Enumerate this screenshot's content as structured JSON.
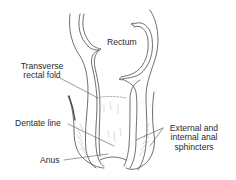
{
  "figure": {
    "type": "anatomical-illustration",
    "colors": {
      "line": "#4a4a4a",
      "label_text": "#2a2a2a",
      "leader_line": "#555555",
      "background": "#ffffff"
    }
  },
  "labels": {
    "rectum": "Rectum",
    "transverse_line1": "Transverse",
    "transverse_line2": "rectal fold",
    "dentate": "Dentate line",
    "anus": "Anus",
    "sphincters_line1": "External and",
    "sphincters_line2": "internal anal",
    "sphincters_line3": "sphincters"
  }
}
